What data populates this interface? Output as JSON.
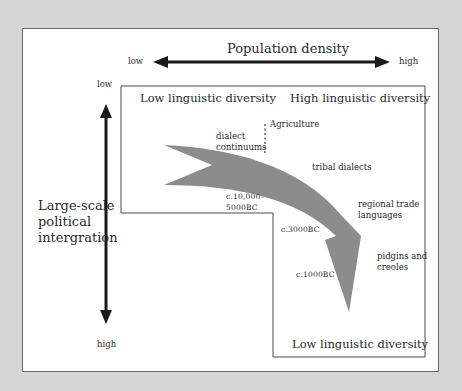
{
  "diagram": {
    "horizontal_axis": {
      "title": "Population density",
      "low_label": "low",
      "high_label": "high"
    },
    "vertical_axis": {
      "title_lines": [
        "Large-scale",
        "political",
        "intergration"
      ],
      "low_label": "low",
      "high_label": "high"
    },
    "regions": {
      "top_left": "Low linguistic diversity",
      "top_right": "High linguistic diversity",
      "bottom_right": "Low linguistic diversity"
    },
    "markers": {
      "agriculture": "Agriculture"
    },
    "stages": [
      {
        "id": "dialect",
        "lines": [
          "dialect",
          "continuums"
        ]
      },
      {
        "id": "tribal",
        "lines": [
          "tribal dialects"
        ]
      },
      {
        "id": "regional",
        "lines": [
          "regional trade",
          "languages"
        ]
      },
      {
        "id": "pidgins",
        "lines": [
          "pidgins and",
          "creoles"
        ]
      }
    ],
    "dates": [
      {
        "id": "d1",
        "lines": [
          "c.10,000–",
          "5000BC"
        ]
      },
      {
        "id": "d2",
        "lines": [
          "c.3000BC"
        ]
      },
      {
        "id": "d3",
        "lines": [
          "c.1000BC"
        ]
      }
    ],
    "colors": {
      "background": "#d5d5d5",
      "panel": "#ffffff",
      "arrow_fill": "#8c8c8c",
      "axis": "#1a1a1a",
      "border": "#6a6a6a"
    }
  }
}
